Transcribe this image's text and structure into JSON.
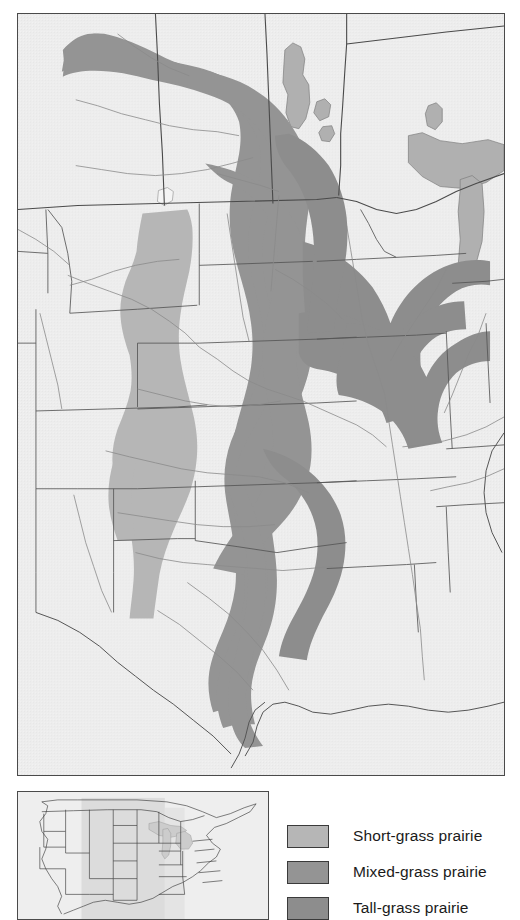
{
  "figure": {
    "kind": "thematic-map"
  },
  "colors": {
    "land": "#ededed",
    "water": "#b0b0b0",
    "border_line": "#4a4a4a",
    "state_line": "#555555",
    "river_line": "#8a8a8a",
    "short_grass": "#b6b6b6",
    "mixed_grass": "#949494",
    "tall_grass": "#8d8d8d",
    "frame": "#4a4a4a",
    "inset_highlight": "#d8d8d8",
    "text": "#1a1a1a"
  },
  "main_map": {
    "name": "prairie-regions-map",
    "regions": [
      {
        "id": "short-grass",
        "label": "Short-grass prairie",
        "fill": "#b6b6b6"
      },
      {
        "id": "mixed-grass",
        "label": "Mixed-grass prairie",
        "fill": "#949494"
      },
      {
        "id": "tall-grass",
        "label": "Tall-grass prairie",
        "fill": "#8d8d8d"
      }
    ],
    "water_bodies": [
      "Lake Winnipeg",
      "Lake Winnipegosis",
      "Lake Manitoba",
      "Lake of the Woods",
      "Lake Superior",
      "Lake Michigan",
      "Lake Nipigon",
      "Devils Lake"
    ]
  },
  "inset_map": {
    "name": "locator-inset-map",
    "description": "United States and southern Canada locator with shaded extent box"
  },
  "legend": {
    "name": "map-legend",
    "items": [
      {
        "label": "Short-grass prairie",
        "swatch": "#b6b6b6"
      },
      {
        "label": "Mixed-grass prairie",
        "swatch": "#949494"
      },
      {
        "label": "Tall-grass prairie",
        "swatch": "#8d8d8d"
      }
    ]
  }
}
